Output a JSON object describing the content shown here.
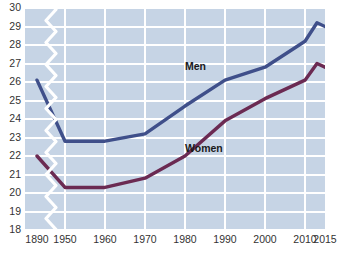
{
  "chart_data": {
    "type": "line",
    "title": "",
    "subtitle": "",
    "xlabel": "",
    "ylabel": "",
    "xlim": [
      1890,
      2015
    ],
    "ylim": [
      18,
      30
    ],
    "grid": true,
    "axis_break": true,
    "axis_break_note": "x-axis broken between 1890 and 1950",
    "legend_position": "inline-annotations",
    "y_ticks": [
      30,
      29,
      28,
      27,
      26,
      25,
      24,
      23,
      22,
      21,
      20,
      19,
      18
    ],
    "x_ticks": [
      1890,
      1950,
      1960,
      1970,
      1980,
      1990,
      2000,
      2010,
      2015
    ],
    "x_tick_labels": [
      "1890",
      "1950",
      "1960",
      "1970",
      "1980",
      "1990",
      "2000",
      "2010",
      "2015"
    ],
    "series": [
      {
        "name": "Men",
        "color": "#3f4f8a",
        "x": [
          1890,
          1950,
          1960,
          1970,
          1980,
          1990,
          2000,
          2010,
          2013,
          2015
        ],
        "values": [
          26.1,
          22.8,
          22.8,
          23.2,
          24.7,
          26.1,
          26.8,
          28.2,
          29.2,
          29.0
        ]
      },
      {
        "name": "Women",
        "color": "#6b2a52",
        "x": [
          1890,
          1950,
          1960,
          1970,
          1980,
          1990,
          2000,
          2010,
          2013,
          2015
        ],
        "values": [
          22.0,
          20.3,
          20.3,
          20.8,
          22.0,
          23.9,
          25.1,
          26.1,
          27.0,
          26.8
        ]
      }
    ],
    "annotations": [
      {
        "text": "Men",
        "x": 1983,
        "y": 26.8
      },
      {
        "text": "Women",
        "x": 1985,
        "y": 22.4
      }
    ]
  },
  "colors": {
    "plot_background": "#c6d4e5",
    "gridline": "#ffffff",
    "men_line": "#3f4f8a",
    "women_line": "#6b2a52",
    "page_background": "#ffffff",
    "tick_text": "#333333"
  }
}
